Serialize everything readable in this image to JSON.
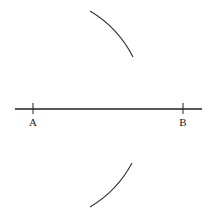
{
  "diagram": {
    "segment": {
      "x1": 15,
      "x2": 202,
      "y": 109
    },
    "points": [
      {
        "label": "A",
        "x": 33,
        "y": 109
      },
      {
        "label": "B",
        "x": 183,
        "y": 109
      }
    ],
    "arcs": [
      {
        "center": "A",
        "radius": 113,
        "from": [
          90,
          11
        ],
        "to": [
          133,
          57
        ]
      },
      {
        "center": "A",
        "radius": 113,
        "from": [
          132,
          163
        ],
        "to": [
          90,
          207
        ]
      }
    ],
    "stroke_color": "#222222"
  }
}
